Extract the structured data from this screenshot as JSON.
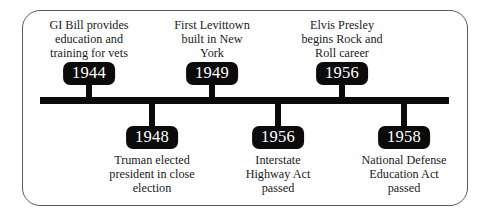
{
  "chart_data": {
    "type": "timeline",
    "title": "",
    "orientation": "horizontal",
    "axis_label": "",
    "events": [
      {
        "year": "1944",
        "side": "above",
        "description": "GI Bill provides education and training for vets",
        "lines": [
          "GI Bill provides",
          "education and",
          "training for vets"
        ]
      },
      {
        "year": "1948",
        "side": "below",
        "description": "Truman elected president in close election",
        "lines": [
          "Truman elected",
          "president in close",
          "election"
        ]
      },
      {
        "year": "1949",
        "side": "above",
        "description": "First Levittown built in New York",
        "lines": [
          "First Levittown",
          "built in New",
          "York"
        ]
      },
      {
        "year": "1956",
        "side": "below",
        "description": "Interstate Highway Act passed",
        "lines": [
          "Interstate",
          "Highway Act",
          "passed"
        ]
      },
      {
        "year": "1956",
        "side": "above",
        "description": "Elvis Presley begins Rock and Roll career",
        "lines": [
          "Elvis Presley",
          "begins Rock and",
          "Roll career"
        ]
      },
      {
        "year": "1958",
        "side": "below",
        "description": "National Defense Education Act passed",
        "lines": [
          "National Defense",
          "Education Act",
          "passed"
        ]
      }
    ],
    "colors": {
      "bar": "#0b0b0b",
      "badge_background": "#0b0b0b",
      "badge_text": "#ffffff",
      "caption_text": "#1a1a1a",
      "frame_border": "#5a5a5a",
      "background": "#ffffff"
    }
  },
  "timeline": {
    "above": [
      {
        "year": "1944",
        "line1": "GI Bill provides",
        "line2": "education and",
        "line3": "training for vets"
      },
      {
        "year": "1949",
        "line1": "First Levittown",
        "line2": "built in New",
        "line3": "York"
      },
      {
        "year": "1956",
        "line1": "Elvis Presley",
        "line2": "begins Rock and",
        "line3": "Roll career"
      }
    ],
    "below": [
      {
        "year": "1948",
        "line1": "Truman elected",
        "line2": "president in close",
        "line3": "election"
      },
      {
        "year": "1956",
        "line1": "Interstate",
        "line2": "Highway Act",
        "line3": "passed"
      },
      {
        "year": "1958",
        "line1": "National Defense",
        "line2": "Education Act",
        "line3": "passed"
      }
    ]
  }
}
